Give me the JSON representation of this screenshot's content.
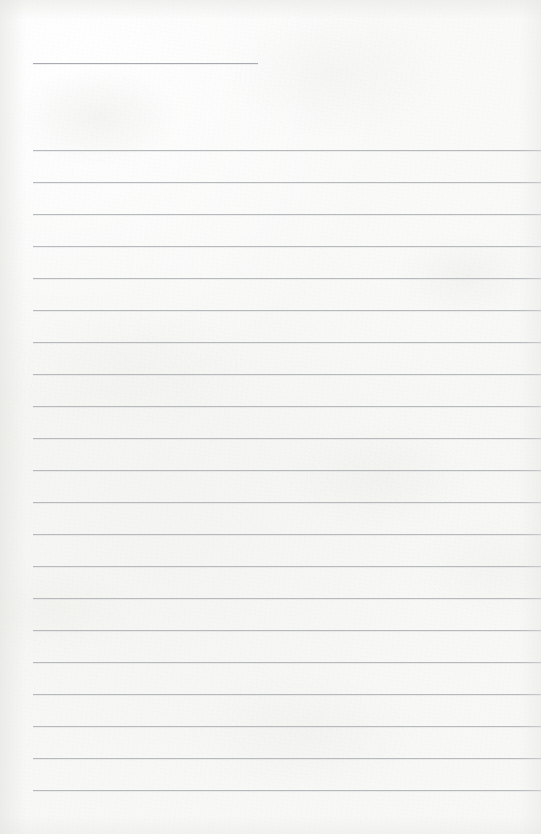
{
  "page": {
    "kind": "lined-writing-paper",
    "width": 541,
    "height": 834,
    "paper_color": "#f7f7f6",
    "rule_color": "#b6babd",
    "title_rule_color": "#a8acb0",
    "left_margin_x": 33,
    "right_edge_x": 541,
    "rule_spacing": 32,
    "text_content": ""
  },
  "title_rule": {
    "name": "title-rule",
    "y": 63,
    "x_start": 33,
    "x_end": 258,
    "length": 225
  },
  "body_rules": [
    {
      "index": 1,
      "y": 150,
      "x_start": 33,
      "x_end": 541
    },
    {
      "index": 2,
      "y": 182,
      "x_start": 33,
      "x_end": 541
    },
    {
      "index": 3,
      "y": 214,
      "x_start": 33,
      "x_end": 541
    },
    {
      "index": 4,
      "y": 246,
      "x_start": 33,
      "x_end": 541
    },
    {
      "index": 5,
      "y": 278,
      "x_start": 33,
      "x_end": 541
    },
    {
      "index": 6,
      "y": 310,
      "x_start": 33,
      "x_end": 541
    },
    {
      "index": 7,
      "y": 342,
      "x_start": 33,
      "x_end": 541
    },
    {
      "index": 8,
      "y": 374,
      "x_start": 33,
      "x_end": 541
    },
    {
      "index": 9,
      "y": 406,
      "x_start": 33,
      "x_end": 541
    },
    {
      "index": 10,
      "y": 438,
      "x_start": 33,
      "x_end": 541
    },
    {
      "index": 11,
      "y": 470,
      "x_start": 33,
      "x_end": 541
    },
    {
      "index": 12,
      "y": 502,
      "x_start": 33,
      "x_end": 541
    },
    {
      "index": 13,
      "y": 534,
      "x_start": 33,
      "x_end": 541
    },
    {
      "index": 14,
      "y": 566,
      "x_start": 33,
      "x_end": 541
    },
    {
      "index": 15,
      "y": 598,
      "x_start": 33,
      "x_end": 541
    },
    {
      "index": 16,
      "y": 630,
      "x_start": 33,
      "x_end": 541
    },
    {
      "index": 17,
      "y": 662,
      "x_start": 33,
      "x_end": 541
    },
    {
      "index": 18,
      "y": 694,
      "x_start": 33,
      "x_end": 541
    },
    {
      "index": 19,
      "y": 726,
      "x_start": 33,
      "x_end": 541
    },
    {
      "index": 20,
      "y": 758,
      "x_start": 33,
      "x_end": 541
    },
    {
      "index": 21,
      "y": 790,
      "x_start": 33,
      "x_end": 541
    }
  ]
}
